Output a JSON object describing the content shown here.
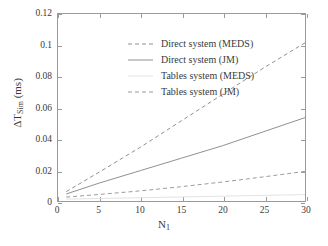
{
  "chart_data": {
    "type": "line",
    "title": "",
    "xlabel": "N_1",
    "xlabel_base": "N",
    "xlabel_sub": "1",
    "ylabel": "ΔT_Sim (ms)",
    "ylabel_base": "ΔT",
    "ylabel_sub": "Sim",
    "ylabel_unit": " (ms)",
    "xlim": [
      0,
      30
    ],
    "ylim": [
      0,
      0.12
    ],
    "xticks": [
      0,
      5,
      10,
      15,
      20,
      25,
      30
    ],
    "xtick_labels": [
      "0",
      "5",
      "10",
      "15",
      "20",
      "25",
      "30"
    ],
    "yticks": [
      0,
      0.02,
      0.04,
      0.06,
      0.08,
      0.1,
      0.12
    ],
    "ytick_labels": [
      "0",
      "0.02",
      "0.04",
      "0.06",
      "0.08",
      "0.1",
      "0.12"
    ],
    "grid": false,
    "legend_position": "upper-left-inside",
    "x": [
      1,
      5,
      10,
      15,
      20,
      25,
      30
    ],
    "series": [
      {
        "name": "Direct system (MEDS)",
        "style": "dashed",
        "color": "#8f8f8f",
        "values": [
          0.006,
          0.0185,
          0.0345,
          0.0515,
          0.0685,
          0.0855,
          0.1015
        ]
      },
      {
        "name": "Direct system (JM)",
        "style": "solid",
        "color": "#8f8f8f",
        "values": [
          0.0045,
          0.0115,
          0.0195,
          0.0275,
          0.0355,
          0.0445,
          0.0535
        ]
      },
      {
        "name": "Tables system (MEDS)",
        "style": "solid",
        "color": "#e2e2e2",
        "values": [
          0.0012,
          0.0016,
          0.0021,
          0.0026,
          0.0031,
          0.0036,
          0.0041
        ]
      },
      {
        "name": "Tables system (JM)",
        "style": "dashed",
        "color": "#9b9b9b",
        "values": [
          0.0025,
          0.0042,
          0.0065,
          0.0092,
          0.0122,
          0.0155,
          0.019
        ]
      }
    ]
  },
  "legend": {
    "items": [
      {
        "label": "Direct system (MEDS)"
      },
      {
        "label": "Direct system (JM)"
      },
      {
        "label": "Tables system (MEDS)"
      },
      {
        "label": "Tables system (JM)"
      }
    ]
  }
}
